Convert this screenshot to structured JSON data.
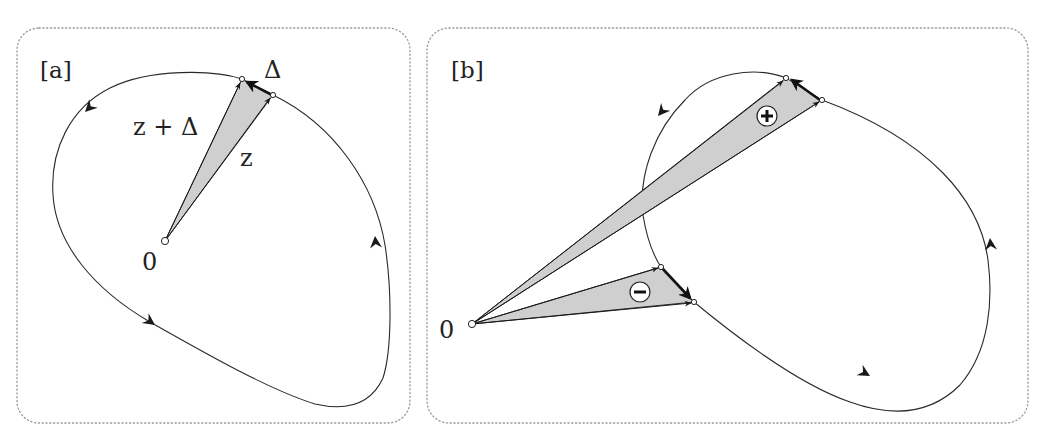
{
  "figure": {
    "panels": [
      {
        "id": "a",
        "label": "[a]",
        "origin_label": "0",
        "labels": {
          "z_plus_delta": "z + Δ",
          "z": "z",
          "delta": "Δ"
        }
      },
      {
        "id": "b",
        "label": "[b]",
        "origin_label": "0",
        "signs": {
          "positive": "+",
          "negative": "−"
        }
      }
    ],
    "colors": {
      "wedge_fill": "#cfcfcf",
      "curve": "#2a2a2a",
      "border": "#9a9a9a"
    }
  }
}
